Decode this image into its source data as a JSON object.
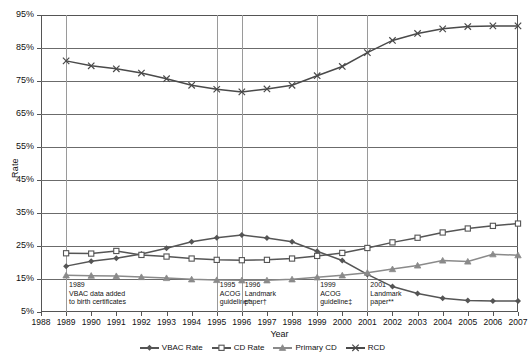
{
  "chart_data": {
    "type": "line",
    "title": "",
    "xlabel": "Year",
    "ylabel": "Rate",
    "x": [
      1988,
      1989,
      1990,
      1991,
      1992,
      1993,
      1994,
      1995,
      1996,
      1997,
      1998,
      1999,
      2000,
      2001,
      2002,
      2003,
      2004,
      2005,
      2006,
      2007
    ],
    "xlim": [
      1988,
      2007
    ],
    "ylim": [
      5,
      95
    ],
    "yticks": [
      "5%",
      "15%",
      "25%",
      "35%",
      "45%",
      "55%",
      "65%",
      "75%",
      "85%",
      "95%"
    ],
    "xticks": [
      "1988",
      "1989",
      "1990",
      "1991",
      "1992",
      "1993",
      "1994",
      "1995",
      "1996",
      "1997",
      "1998",
      "1999",
      "2000",
      "2001",
      "2002",
      "2003",
      "2004",
      "2005",
      "2006",
      "2007"
    ],
    "grid": true,
    "legend_position": "bottom",
    "series": [
      {
        "name": "VBAC Rate",
        "marker": "plus",
        "color": "#555555",
        "x": [
          1989,
          1990,
          1991,
          1992,
          1993,
          1994,
          1995,
          1996,
          1997,
          1998,
          1999,
          2000,
          2001,
          2002,
          2003,
          2004,
          2005,
          2006,
          2007
        ],
        "values": [
          18.9,
          20.4,
          21.3,
          22.6,
          24.3,
          26.3,
          27.5,
          28.3,
          27.4,
          26.3,
          23.4,
          20.6,
          16.4,
          12.7,
          10.6,
          9.2,
          8.5,
          8.3,
          8.3
        ]
      },
      {
        "name": "CD Rate",
        "marker": "square",
        "color": "#555555",
        "x": [
          1989,
          1990,
          1991,
          1992,
          1993,
          1994,
          1995,
          1996,
          1997,
          1998,
          1999,
          2000,
          2001,
          2002,
          2003,
          2004,
          2005,
          2006,
          2007
        ],
        "values": [
          22.8,
          22.7,
          23.5,
          22.3,
          21.8,
          21.2,
          20.8,
          20.7,
          20.8,
          21.2,
          22.0,
          22.9,
          24.4,
          26.1,
          27.5,
          29.1,
          30.3,
          31.1,
          31.8
        ]
      },
      {
        "name": "Primary CD",
        "marker": "triangle",
        "color": "#8a8a8a",
        "x": [
          1989,
          1990,
          1991,
          1992,
          1993,
          1994,
          1995,
          1996,
          1997,
          1998,
          1999,
          2000,
          2001,
          2002,
          2003,
          2004,
          2005,
          2006,
          2007
        ],
        "values": [
          16.1,
          16.0,
          15.9,
          15.6,
          15.3,
          14.9,
          14.7,
          14.6,
          14.6,
          14.9,
          15.5,
          16.1,
          16.9,
          18.0,
          19.1,
          20.6,
          20.3,
          22.5,
          22.2
        ]
      },
      {
        "name": "RCD",
        "marker": "cross",
        "color": "#4a4a4a",
        "x": [
          1989,
          1990,
          1991,
          1992,
          1993,
          1994,
          1995,
          1996,
          1997,
          1998,
          1999,
          2000,
          2001,
          2002,
          2003,
          2004,
          2005,
          2006,
          2007
        ],
        "values": [
          81.1,
          79.6,
          78.7,
          77.4,
          75.7,
          73.7,
          72.5,
          71.7,
          72.6,
          73.7,
          76.6,
          79.4,
          83.6,
          87.3,
          89.4,
          90.8,
          91.5,
          91.7,
          91.7
        ]
      }
    ],
    "annotations": [
      {
        "year": 1989,
        "lines": [
          "1989",
          "VBAC data added",
          "to birth certificates"
        ],
        "vline": true
      },
      {
        "year": 1995,
        "lines": [
          "1995",
          "ACOG",
          "guideline*"
        ],
        "vline": true
      },
      {
        "year": 1996,
        "lines": [
          "1996",
          "Landmark",
          "paper†"
        ],
        "vline": true
      },
      {
        "year": 1999,
        "lines": [
          "1999",
          "ACOG",
          "guideline‡"
        ],
        "vline": true
      },
      {
        "year": 2001,
        "lines": [
          "2001",
          "Landmark",
          "paper**"
        ],
        "vline": true
      }
    ]
  },
  "legend": {
    "items": [
      {
        "label": "VBAC Rate"
      },
      {
        "label": "CD Rate"
      },
      {
        "label": "Primary CD"
      },
      {
        "label": "RCD"
      }
    ]
  }
}
